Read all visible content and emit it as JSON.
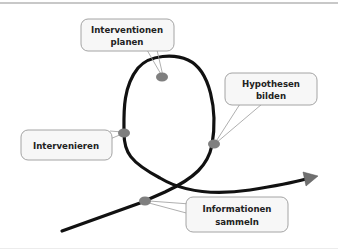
{
  "diagram": {
    "type": "intervention-cycle-loop",
    "colors": {
      "path": "#111111",
      "node": "#7f7f7f",
      "callout_fill": "#f7f7f7",
      "callout_border": "#9a9a9a",
      "arrowhead": "#6f6f6f"
    },
    "nodes": [
      {
        "id": "informationen-sammeln",
        "lines": [
          "Informationen",
          "sammeln"
        ]
      },
      {
        "id": "hypothesen-bilden",
        "lines": [
          "Hypothesen",
          "bilden"
        ]
      },
      {
        "id": "interventionen-planen",
        "lines": [
          "Interventionen",
          "planen"
        ]
      },
      {
        "id": "intervenieren",
        "lines": [
          "Intervenieren"
        ]
      }
    ]
  }
}
